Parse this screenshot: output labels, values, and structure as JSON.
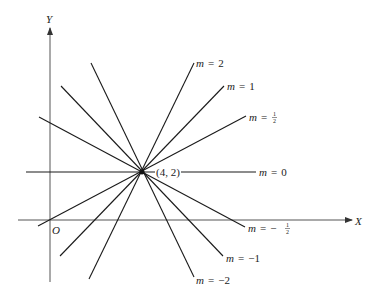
{
  "diagram": {
    "axes": {
      "x_label": "X",
      "y_label": "Y",
      "origin_label": "O"
    },
    "point": {
      "label": "(4, 2)",
      "x": 4,
      "y": 2
    },
    "lines": [
      {
        "slope": "2",
        "label_m": "m",
        "label_eq": "=",
        "label_val": "2"
      },
      {
        "slope": "1",
        "label_m": "m",
        "label_eq": "=",
        "label_val": "1"
      },
      {
        "slope": "1/2",
        "label_m": "m",
        "label_eq": "=",
        "label_num": "1",
        "label_den": "2"
      },
      {
        "slope": "0",
        "label_m": "m",
        "label_eq": "=",
        "label_val": "0"
      },
      {
        "slope": "-1/2",
        "label_m": "m",
        "label_eq": "=",
        "label_sign": "−",
        "label_num": "1",
        "label_den": "2"
      },
      {
        "slope": "-1",
        "label_m": "m",
        "label_eq": "=",
        "label_val": "−1"
      },
      {
        "slope": "-2",
        "label_m": "m",
        "label_eq": "=",
        "label_val": "−2"
      }
    ],
    "colors": {
      "line": "#1a1a1a",
      "axis": "#555555",
      "text": "#222222"
    }
  }
}
